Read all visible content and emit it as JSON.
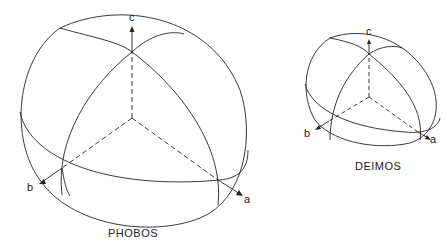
{
  "bodies": [
    {
      "name": "PHOBOS",
      "axes": {
        "a": "a",
        "b": "b",
        "c": "c"
      }
    },
    {
      "name": "DEIMOS",
      "axes": {
        "a": "a",
        "b": "b",
        "c": "c"
      }
    }
  ],
  "colors": {
    "line": "#222222",
    "background": "#ffffff"
  }
}
